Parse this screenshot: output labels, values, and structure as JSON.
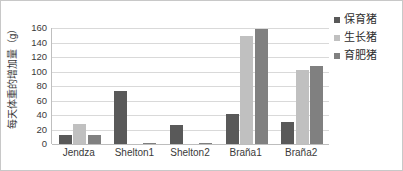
{
  "chart_data": {
    "type": "bar",
    "title": "",
    "subtitle": "",
    "xlabel": "",
    "ylabel": "每天体重的增加量（g）",
    "categories": [
      "Jendza",
      "Shelton1",
      "Shelton2",
      "Braña1",
      "Braña2"
    ],
    "series": [
      {
        "name": "保育猪",
        "color": "#595959",
        "values": [
          12,
          73,
          26,
          41,
          30
        ]
      },
      {
        "name": "生长猪",
        "color": "#c0c0c0",
        "values": [
          27,
          0,
          0,
          149,
          102
        ]
      },
      {
        "name": "育肥猪",
        "color": "#808080",
        "values": [
          13,
          1,
          1,
          158,
          108
        ]
      }
    ],
    "ylim": [
      0,
      160
    ],
    "ytick_step": 20,
    "yticks": [
      0,
      20,
      40,
      60,
      80,
      100,
      120,
      140,
      160
    ],
    "grid": true,
    "legend_position": "right",
    "colors": {
      "gridline": "#d9d9d9",
      "axis": "#bfbfbf",
      "text": "#3a3a3a",
      "background": "#ffffff",
      "border": "#c8c8c8"
    }
  }
}
